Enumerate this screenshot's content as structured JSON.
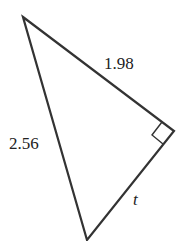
{
  "diagram": {
    "type": "right-triangle",
    "labels": {
      "hypotenuse": "2.56",
      "leg_top": "1.98",
      "leg_bottom": "t"
    },
    "right_angle_marker": true,
    "stroke_color": "#333333"
  }
}
